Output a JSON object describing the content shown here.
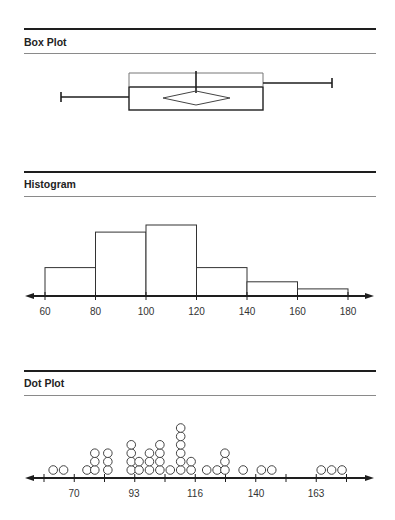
{
  "panels": {
    "box": {
      "title": "Box Plot"
    },
    "hist": {
      "title": "Histogram"
    },
    "dot": {
      "title": "Dot Plot"
    }
  },
  "colors": {
    "line": "#1e1e1e",
    "thin_rule": "#8a8a8a",
    "bar_stroke": "#333333",
    "dot_stroke": "#444444"
  },
  "chart_data": [
    {
      "type": "box",
      "title": "Box Plot",
      "orientation": "horizontal",
      "stats_estimated": {
        "min": 65,
        "q1": 91,
        "median": 117,
        "mean": 117,
        "q3": 143,
        "max": 169
      },
      "mean_marker": "diamond",
      "shortest_half_bracket": true,
      "note": "No axis drawn; values estimated from shared scale"
    },
    {
      "type": "bar",
      "title": "Histogram",
      "bins": [
        "60-80",
        "80-100",
        "100-120",
        "120-140",
        "140-160",
        "160-180"
      ],
      "categories": [
        "60",
        "80",
        "100",
        "120",
        "140",
        "160",
        "180"
      ],
      "values": [
        4,
        9,
        10,
        4,
        2,
        1
      ],
      "xlabel": "",
      "ylabel": "",
      "xlim": [
        60,
        180
      ],
      "tick_labels": [
        "60",
        "80",
        "100",
        "120",
        "140",
        "160",
        "180"
      ],
      "grid": false
    },
    {
      "type": "scatter",
      "subtype": "dot",
      "title": "Dot Plot",
      "x": [
        62,
        66,
        75,
        78,
        83,
        92,
        95,
        99,
        103,
        107,
        111,
        115,
        121,
        125,
        128,
        135,
        142,
        146,
        165,
        169,
        173
      ],
      "counts": [
        1,
        1,
        1,
        3,
        3,
        4,
        2,
        3,
        4,
        1,
        6,
        2,
        1,
        1,
        3,
        1,
        1,
        1,
        1,
        1,
        1
      ],
      "tick_labels": [
        "70",
        "93",
        "116",
        "140",
        "163"
      ],
      "xlabel": "",
      "ylabel": "",
      "grid": false
    }
  ]
}
